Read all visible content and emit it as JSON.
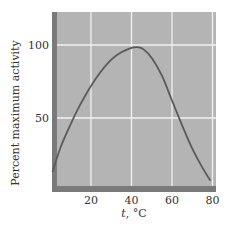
{
  "chart_data": {
    "type": "line",
    "title": "",
    "xlabel": "t, °C",
    "xlabel_italic_part": "t",
    "xlabel_rest": ", °C",
    "ylabel": "Percent maximum activity",
    "xlim": [
      0,
      82
    ],
    "ylim": [
      0,
      115
    ],
    "xticks": [
      20,
      40,
      60,
      80
    ],
    "xtick_labels": [
      "20",
      "40",
      "60",
      "80"
    ],
    "yticks": [
      50,
      100
    ],
    "ytick_labels": [
      "50",
      "100"
    ],
    "grid": true,
    "legend": null,
    "series": [
      {
        "name": "Enzyme activity",
        "x": [
          1,
          5,
          10,
          15,
          20,
          25,
          30,
          35,
          40,
          43,
          46,
          50,
          55,
          60,
          65,
          70,
          75,
          79
        ],
        "y": [
          13,
          30,
          46,
          60,
          72,
          82,
          90,
          95,
          98,
          98.5,
          97,
          91,
          79,
          62,
          45,
          29,
          16,
          7
        ]
      }
    ],
    "colors": {
      "plot_background": "#b4b4b4",
      "frame": "#7a7a7a",
      "gridline": "#f2f2f2",
      "curve": "#5a5a5a",
      "text": "#333333"
    }
  }
}
